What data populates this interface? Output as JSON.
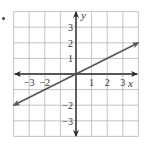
{
  "bullet": "•",
  "chart_data": {
    "type": "line",
    "title": "",
    "xlabel": "x",
    "ylabel": "y",
    "xlim": [
      -4,
      4
    ],
    "ylim": [
      -4,
      4
    ],
    "grid": true,
    "x_ticks": [
      "-3",
      "-2",
      "1",
      "2",
      "3"
    ],
    "y_ticks": [
      "3",
      "2",
      "1",
      "-2",
      "-3"
    ],
    "series": [
      {
        "name": "line",
        "equation": "y = 0.5x",
        "x": [
          -4,
          4
        ],
        "y": [
          -2,
          2
        ],
        "arrows_both_ends": true
      }
    ]
  },
  "colors": {
    "grid": "#b5b5b5",
    "axis": "#2a2a2a",
    "line": "#555555"
  }
}
